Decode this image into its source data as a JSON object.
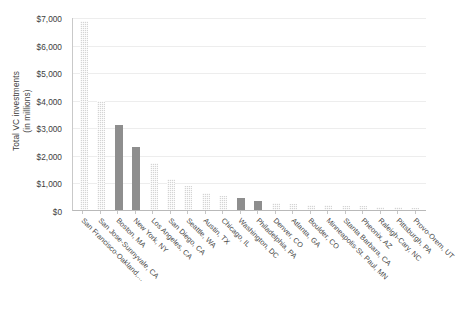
{
  "chart_data": {
    "type": "bar",
    "title": "",
    "xlabel": "",
    "ylabel": "Total VC  investments (in millions)",
    "ylabel_line1": "Total VC  investments",
    "ylabel_line2": "(in millions)",
    "ylim": [
      0,
      7000
    ],
    "ytick_values": [
      0,
      1000,
      2000,
      3000,
      4000,
      5000,
      6000,
      7000
    ],
    "ytick_labels": [
      "$0",
      "$1,000",
      "$2,000",
      "$3,000",
      "$4,000",
      "$5,000",
      "$6,000",
      "$7,000"
    ],
    "grid": true,
    "grid_axis": "y",
    "legend": false,
    "categories": [
      "San Francisco-Oakland,...",
      "San Jose-Sunnyvale, CA",
      "Boston, MA",
      "New York, NY",
      "Los Angeles, CA",
      "San Diego, CA",
      "Seattle, WA",
      "Austin, TX",
      "Chicago, IL",
      "Washington, DC",
      "Philadelphia, PA",
      "Denver, CO",
      "Atlanta, GA",
      "Boulder, CO",
      "Minneapolis-St. Paul, MN",
      "Stanta Barbara, CA",
      "Pheonix, AZ",
      "Raleigh-Cary, NC",
      "Pittsburgh, PA",
      "Provo-Orem, UT"
    ],
    "values": [
      6850,
      3970,
      3100,
      2290,
      1720,
      1130,
      860,
      620,
      520,
      430,
      320,
      250,
      210,
      185,
      165,
      150,
      135,
      120,
      100,
      85
    ],
    "bar_styles": [
      "light",
      "light",
      "dark",
      "dark",
      "light",
      "light",
      "light",
      "light",
      "light",
      "dark",
      "dark",
      "light",
      "light",
      "light",
      "light",
      "light",
      "light",
      "light",
      "light",
      "light"
    ],
    "colors": {
      "bar_light": "#d4d4d4",
      "bar_dark": "#8e8e8e",
      "gridline": "#ededed",
      "axis": "#b9b9b9",
      "text": "#3d3d3d",
      "background": "#ffffff"
    }
  },
  "caption": ""
}
